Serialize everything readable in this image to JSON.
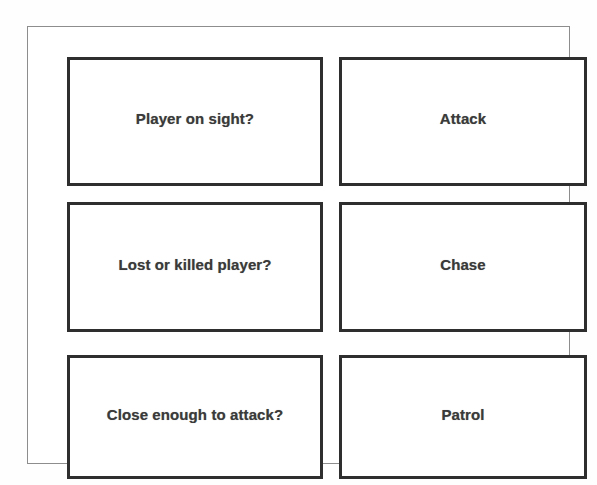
{
  "diagram": {
    "style": {
      "box_border_color": "#2e2e2e",
      "frame_border_color": "#8d8d8d",
      "text_color": "#3a3a3a",
      "background_color": "#ffffff"
    },
    "columns": [
      {
        "name": "conditions"
      },
      {
        "name": "states"
      }
    ],
    "rows": [
      {
        "condition": "Player on sight?",
        "state": "Attack"
      },
      {
        "condition": "Lost or killed player?",
        "state": "Chase"
      },
      {
        "condition": "Close enough to attack?",
        "state": "Patrol"
      }
    ]
  }
}
